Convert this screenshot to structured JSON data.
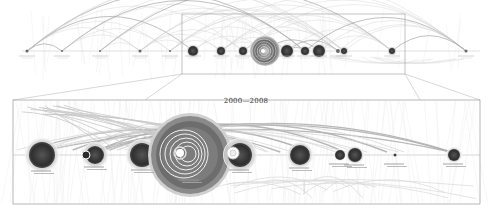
{
  "figure": {
    "type": "arc-bubble-timeline",
    "detail_title": "2000—2008",
    "overview": {
      "frame": {
        "x": 182,
        "y": 14,
        "w": 223,
        "h": 60
      },
      "baseline_y": 51,
      "nodes": [
        {
          "x": 27,
          "r": 1.5
        },
        {
          "x": 62,
          "r": 1
        },
        {
          "x": 100,
          "r": 1
        },
        {
          "x": 140,
          "r": 1.5
        },
        {
          "x": 170,
          "r": 1
        },
        {
          "x": 193,
          "r": 5
        },
        {
          "x": 221,
          "r": 4
        },
        {
          "x": 243,
          "r": 4
        },
        {
          "x": 265,
          "r": 15
        },
        {
          "x": 287,
          "r": 6
        },
        {
          "x": 305,
          "r": 4
        },
        {
          "x": 319,
          "r": 6
        },
        {
          "x": 338,
          "r": 2
        },
        {
          "x": 344,
          "r": 3
        },
        {
          "x": 392,
          "r": 3
        },
        {
          "x": 466,
          "r": 1.5
        }
      ]
    },
    "detail": {
      "frame": {
        "x": 13,
        "y": 100,
        "w": 467,
        "h": 104
      },
      "baseline_y": 155,
      "nodes": [
        {
          "x": 42,
          "r": 13,
          "halo": 17,
          "label": "· · ·"
        },
        {
          "x": 95,
          "r": 9,
          "halo": 13,
          "label": "· · ·"
        },
        {
          "x": 86,
          "r": 4,
          "halo": 0,
          "label": ""
        },
        {
          "x": 142,
          "r": 12,
          "halo": 16,
          "label": "· · ·"
        },
        {
          "x": 190,
          "r": 22,
          "halo": 42,
          "label": "· · ·"
        },
        {
          "x": 240,
          "r": 12,
          "halo": 17,
          "label": "· · ·"
        },
        {
          "x": 300,
          "r": 10,
          "halo": 13,
          "label": "· · ·"
        },
        {
          "x": 340,
          "r": 5,
          "halo": 6,
          "label": "· · ·"
        },
        {
          "x": 355,
          "r": 7,
          "halo": 9,
          "label": "· · ·"
        },
        {
          "x": 395,
          "r": 1.5,
          "halo": 0,
          "label": "· · ·"
        },
        {
          "x": 454,
          "r": 6,
          "halo": 8,
          "label": "· · ·"
        }
      ]
    },
    "colors": {
      "arc": "#9a9a9a",
      "arc_light": "#cfcfcf",
      "node_dark": "#3a3a3a",
      "ring": "#7d7d7d",
      "frame": "#999999"
    }
  }
}
